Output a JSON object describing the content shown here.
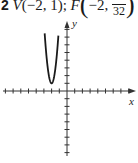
{
  "header": {
    "problem_number": "2",
    "vertex_label": "V",
    "vertex_coords": "(−2, 1);",
    "focus_label": "F",
    "focus_x": "−2,",
    "focus_y_numerator": "",
    "focus_y_denominator": "32"
  },
  "chart_data": {
    "type": "line",
    "title": "",
    "xlabel": "x",
    "ylabel": "y",
    "xlim": [
      -8,
      8
    ],
    "ylim": [
      -8,
      9
    ],
    "grid": false,
    "ticks_unlabeled": true,
    "series": [
      {
        "name": "parabola y = 8(x + 2)^2 + 1",
        "vertex": [
          -2,
          1
        ],
        "x": [
          -2.9,
          -2.75,
          -2.5,
          -2.25,
          -2.0,
          -1.75,
          -1.5,
          -1.25,
          -1.1
        ],
        "y": [
          7.5,
          5.5,
          3.0,
          1.5,
          1.0,
          1.5,
          3.0,
          5.5,
          7.5
        ]
      }
    ],
    "annotations": []
  },
  "colors": {
    "curve": "#1a1a1a",
    "axes": "#333333",
    "background": "#ffffff"
  }
}
